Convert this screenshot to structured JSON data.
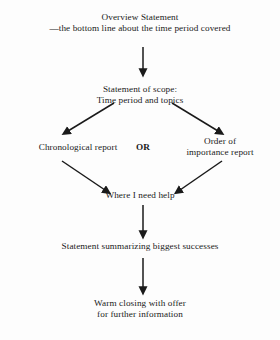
{
  "diagram": {
    "type": "flowchart",
    "background_color": "#fdfdfd",
    "text_color": "#1a1a1a",
    "nodes": {
      "overview": {
        "line1": "Overview Statement",
        "line2": "—the bottom line about the time period covered"
      },
      "scope": {
        "line1": "Statement of scope:",
        "line2": "Time period and topics"
      },
      "chronological": {
        "line1": "Chronological report"
      },
      "order_of_importance": {
        "line1": "Order of",
        "line2": "importance report"
      },
      "help": {
        "line1": "Where I need help"
      },
      "summary": {
        "line1": "Statement summarizing biggest successes"
      },
      "closing": {
        "line1": "Warm closing with offer",
        "line2": "for further information"
      }
    },
    "connector_label": "OR",
    "edges": [
      {
        "name": "overview-to-scope",
        "style": "vertical-arrow"
      },
      {
        "name": "scope-to-chronological",
        "style": "diagonal-arrow-left"
      },
      {
        "name": "scope-to-order-of-importance",
        "style": "diagonal-arrow-right"
      },
      {
        "name": "chronological-to-help",
        "style": "diagonal-arrow-right"
      },
      {
        "name": "order-of-importance-to-help",
        "style": "diagonal-arrow-left"
      },
      {
        "name": "help-to-summary",
        "style": "vertical-arrow"
      },
      {
        "name": "summary-to-closing",
        "style": "vertical-arrow"
      }
    ]
  }
}
